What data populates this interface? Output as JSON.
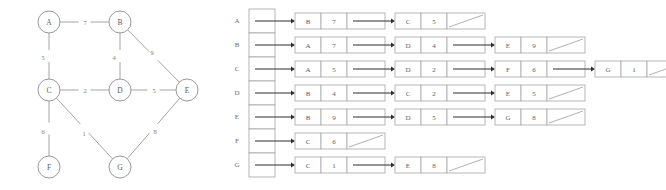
{
  "figure": {
    "graph": {
      "title": "weighted-undirected-graph",
      "nodes": [
        {
          "id": "A",
          "label": "A",
          "cx": 49,
          "cy": 22,
          "r": 11
        },
        {
          "id": "B",
          "label": "B",
          "cx": 120,
          "cy": 22,
          "r": 11
        },
        {
          "id": "C",
          "label": "C",
          "cx": 49,
          "cy": 90,
          "r": 11
        },
        {
          "id": "D",
          "label": "D",
          "cx": 120,
          "cy": 90,
          "r": 11
        },
        {
          "id": "E",
          "label": "E",
          "cx": 187,
          "cy": 90,
          "r": 11
        },
        {
          "id": "F",
          "label": "F",
          "cx": 49,
          "cy": 167,
          "r": 11
        },
        {
          "id": "G",
          "label": "G",
          "cx": 120,
          "cy": 167,
          "r": 11
        }
      ],
      "edges": [
        {
          "from": "A",
          "to": "B",
          "weight": "7",
          "lx": 85,
          "ly": 22
        },
        {
          "from": "A",
          "to": "C",
          "weight": "5",
          "lx": 43,
          "ly": 57
        },
        {
          "from": "B",
          "to": "D",
          "weight": "4",
          "lx": 114,
          "ly": 57
        },
        {
          "from": "B",
          "to": "E",
          "weight": "9",
          "lx": 152,
          "ly": 52
        },
        {
          "from": "C",
          "to": "D",
          "weight": "2",
          "lx": 85,
          "ly": 90
        },
        {
          "from": "D",
          "to": "E",
          "weight": "5",
          "lx": 154,
          "ly": 90
        },
        {
          "from": "C",
          "to": "F",
          "weight": "6",
          "lx": 43,
          "ly": 131
        },
        {
          "from": "C",
          "to": "G",
          "weight": "1",
          "lx": 84,
          "ly": 133
        },
        {
          "from": "E",
          "to": "G",
          "weight": "8",
          "lx": 155,
          "ly": 131
        }
      ]
    },
    "adjacency": {
      "title": "adjacency-list-representation",
      "rows": [
        {
          "key": "A",
          "label": "A",
          "nodes": [
            {
              "vertex": "B",
              "weight": "7",
              "next": true
            },
            {
              "vertex": "C",
              "weight": "5",
              "next": false
            }
          ]
        },
        {
          "key": "B",
          "label": "B",
          "nodes": [
            {
              "vertex": "A",
              "weight": "7",
              "next": true
            },
            {
              "vertex": "D",
              "weight": "4",
              "next": true
            },
            {
              "vertex": "E",
              "weight": "9",
              "next": false
            }
          ]
        },
        {
          "key": "C",
          "label": "C",
          "nodes": [
            {
              "vertex": "A",
              "weight": "5",
              "next": true
            },
            {
              "vertex": "D",
              "weight": "2",
              "next": true
            },
            {
              "vertex": "F",
              "weight": "6",
              "next": true
            },
            {
              "vertex": "G",
              "weight": "1",
              "next": false
            }
          ]
        },
        {
          "key": "D",
          "label": "D",
          "nodes": [
            {
              "vertex": "B",
              "weight": "4",
              "next": true
            },
            {
              "vertex": "C",
              "weight": "2",
              "next": true
            },
            {
              "vertex": "E",
              "weight": "5",
              "next": false
            }
          ]
        },
        {
          "key": "E",
          "label": "E",
          "nodes": [
            {
              "vertex": "B",
              "weight": "9",
              "next": true
            },
            {
              "vertex": "D",
              "weight": "5",
              "next": true
            },
            {
              "vertex": "G",
              "weight": "8",
              "next": false
            }
          ]
        },
        {
          "key": "F",
          "label": "F",
          "nodes": [
            {
              "vertex": "C",
              "weight": "6",
              "next": false
            }
          ]
        },
        {
          "key": "G",
          "label": "G",
          "nodes": [
            {
              "vertex": "C",
              "weight": "1",
              "next": true
            },
            {
              "vertex": "E",
              "weight": "8",
              "next": false
            }
          ]
        }
      ]
    }
  },
  "colors": {
    "stroke": "#9a9a9a",
    "text": "#5d5d5d",
    "arrow": "#2f2f2f",
    "background": "#ffffff"
  }
}
